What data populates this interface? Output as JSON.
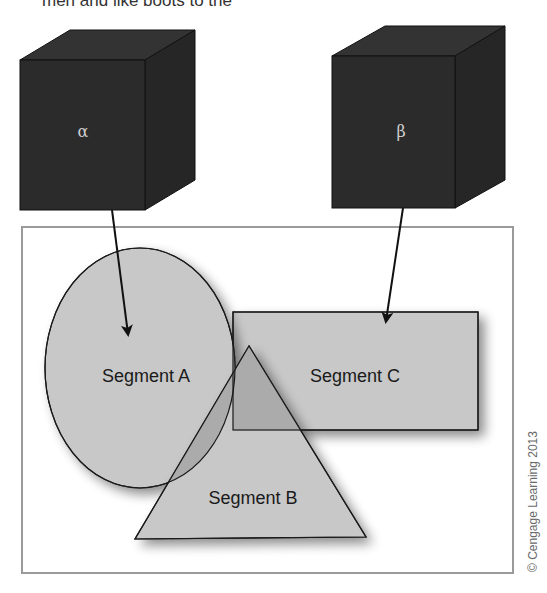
{
  "header_fragment": {
    "text": "men and like boots to the"
  },
  "colors": {
    "cube_front": "#2b2b2b",
    "cube_top": "#333333",
    "cube_side": "#262626",
    "shape_fill": "#c8c8c8",
    "overlap_fill": "#a9a9a9",
    "stroke": "#1a1a1a",
    "frame": "#9a9a9a"
  },
  "cubes": [
    {
      "id": "alpha",
      "symbol": "α"
    },
    {
      "id": "beta",
      "symbol": "β"
    }
  ],
  "segments": {
    "a": {
      "label": "Segment A",
      "shape": "ellipse"
    },
    "b": {
      "label": "Segment B",
      "shape": "triangle"
    },
    "c": {
      "label": "Segment C",
      "shape": "rectangle"
    }
  },
  "arrows": [
    {
      "from": "α",
      "to": "Segment A"
    },
    {
      "from": "β",
      "to": "Segment C"
    }
  ],
  "credit": "© Cengage Learning 2013"
}
